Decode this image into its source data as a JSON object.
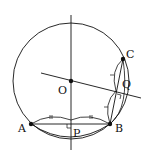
{
  "diagram": {
    "points": {
      "O": {
        "label": "O",
        "x": 71,
        "y": 81
      },
      "A": {
        "label": "A",
        "x": 31,
        "y": 124
      },
      "B": {
        "label": "B",
        "x": 110,
        "y": 124
      },
      "C": {
        "label": "C",
        "x": 123,
        "y": 59
      },
      "P": {
        "label": "P",
        "x": 71,
        "y": 124
      },
      "Q": {
        "label": "Q",
        "x": 116,
        "y": 91
      }
    },
    "circle": {
      "cx": 71,
      "cy": 81,
      "r": 58
    },
    "tick_marks": {
      "AP_BP": "||",
      "BQ_CQ": "|"
    },
    "colors": {
      "stroke": "#111111",
      "background": "#ffffff"
    }
  }
}
